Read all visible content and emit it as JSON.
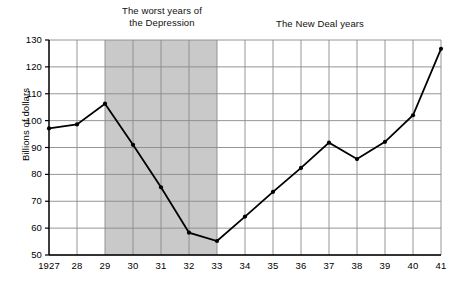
{
  "chart_data": {
    "type": "line",
    "title": "",
    "xlabel": "",
    "ylabel": "Billions of dollars",
    "xlim": [
      1927,
      1941
    ],
    "ylim": [
      50,
      130
    ],
    "ytick_labels": [
      "130",
      "120",
      "110",
      "100",
      "90",
      "80",
      "70",
      "60",
      "50"
    ],
    "ytick_values": [
      130,
      120,
      110,
      100,
      90,
      80,
      70,
      60,
      50
    ],
    "xtick_labels": [
      "1927",
      "28",
      "29",
      "30",
      "31",
      "32",
      "33",
      "34",
      "35",
      "36",
      "37",
      "38",
      "39",
      "40",
      "41"
    ],
    "x": [
      1927,
      1928,
      1929,
      1930,
      1931,
      1932,
      1933,
      1934,
      1935,
      1936,
      1937,
      1938,
      1939,
      1940,
      1941
    ],
    "values": [
      97.1,
      98.6,
      106.3,
      91.0,
      75.2,
      58.3,
      55.2,
      64.3,
      73.5,
      82.4,
      91.8,
      85.7,
      92.1,
      102.0,
      126.7
    ],
    "grid": true,
    "legend": "none",
    "markers": true,
    "annotations": [
      {
        "text": "The worst years of\nthe Depression",
        "x_range": [
          1929,
          1933
        ]
      },
      {
        "text": "The New Deal years",
        "x_range": [
          1933,
          1941
        ]
      }
    ],
    "shaded_band": {
      "x_start": 1929,
      "x_end": 1933,
      "color": "#c9c9c9"
    },
    "colors": {
      "line": "#000000",
      "marker": "#000000",
      "grid": "#8a8a8a",
      "axis": "#000000",
      "background": "#ffffff"
    }
  }
}
